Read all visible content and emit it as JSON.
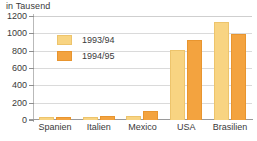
{
  "chart_data": {
    "type": "bar",
    "title": "in Tausend",
    "xlabel": "",
    "ylabel": "in Tausend",
    "categories": [
      "Spanien",
      "Italien",
      "Mexico",
      "USA",
      "Brasilien"
    ],
    "series": [
      {
        "name": "1993/94",
        "color": "#f8d482",
        "values": [
          30,
          35,
          50,
          805,
          1130
        ]
      },
      {
        "name": "1994/95",
        "color": "#f3a33f",
        "values": [
          30,
          45,
          100,
          920,
          990
        ]
      }
    ],
    "ylim": [
      0,
      1200
    ],
    "yticks": [
      0,
      200,
      400,
      600,
      800,
      1000,
      1200
    ],
    "ytick_labels": [
      "0",
      "200",
      "400",
      "600",
      "800",
      "1000",
      "1200"
    ],
    "grid": true,
    "legend_position": "inside-top-left"
  }
}
